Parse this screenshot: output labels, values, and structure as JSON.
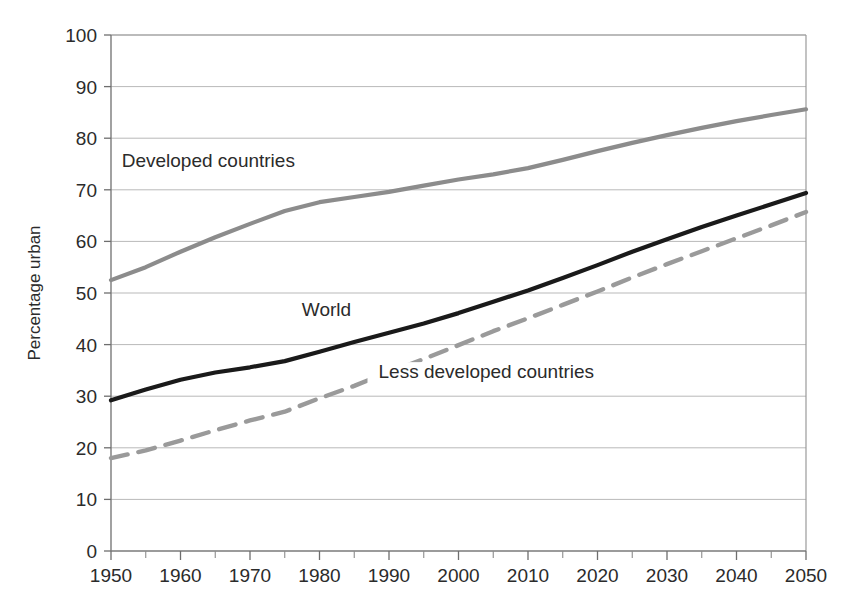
{
  "chart_data": {
    "type": "line",
    "title": "",
    "subtitle": "",
    "xlabel": "",
    "ylabel": "Percentage urban",
    "xlim": [
      1950,
      2050
    ],
    "ylim": [
      0,
      100
    ],
    "grid": "horizontal",
    "legend_position": "inline-annotations",
    "x_tick_labels": [
      "1950",
      "1960",
      "1970",
      "1980",
      "1990",
      "2000",
      "2010",
      "2020",
      "2030",
      "2040",
      "2050"
    ],
    "x_ticks": [
      1950,
      1960,
      1970,
      1980,
      1990,
      2000,
      2010,
      2020,
      2030,
      2040,
      2050
    ],
    "x_minor_ticks": [
      1955,
      1965,
      1975,
      1985,
      1995,
      2005,
      2015,
      2025,
      2035,
      2045
    ],
    "y_tick_labels": [
      "0",
      "10",
      "20",
      "30",
      "40",
      "50",
      "60",
      "70",
      "80",
      "90",
      "100"
    ],
    "y_ticks": [
      0,
      10,
      20,
      30,
      40,
      50,
      60,
      70,
      80,
      90,
      100
    ],
    "x": [
      1950,
      1955,
      1960,
      1965,
      1970,
      1975,
      1980,
      1985,
      1990,
      1995,
      2000,
      2005,
      2010,
      2015,
      2020,
      2025,
      2030,
      2035,
      2040,
      2045,
      2050
    ],
    "series": [
      {
        "name": "Developed countries",
        "color": "#8c8c8c",
        "style": "solid",
        "width": 4.2,
        "label_x": 1964,
        "label_y": 74.5,
        "values": [
          52.5,
          55.0,
          58.0,
          60.8,
          63.4,
          65.9,
          67.6,
          68.6,
          69.6,
          70.8,
          72.0,
          73.0,
          74.2,
          75.8,
          77.5,
          79.1,
          80.6,
          82.0,
          83.3,
          84.5,
          85.6
        ]
      },
      {
        "name": "World",
        "color": "#1a1a1a",
        "style": "solid",
        "width": 4.2,
        "label_x": 1981,
        "label_y": 45.5,
        "values": [
          29.2,
          31.3,
          33.2,
          34.6,
          35.6,
          36.8,
          38.6,
          40.5,
          42.3,
          44.1,
          46.1,
          48.3,
          50.5,
          52.9,
          55.4,
          58.0,
          60.4,
          62.8,
          65.0,
          67.2,
          69.4
        ]
      },
      {
        "name": "Less developed countries",
        "color": "#9a9a9a",
        "style": "dashed",
        "width": 4.4,
        "label_x": 2004,
        "label_y": 33.5,
        "values": [
          18.0,
          19.5,
          21.4,
          23.4,
          25.3,
          27.0,
          29.6,
          32.0,
          34.7,
          37.2,
          39.9,
          42.6,
          45.1,
          47.7,
          50.3,
          53.0,
          55.6,
          58.1,
          60.6,
          63.1,
          65.7
        ]
      }
    ]
  }
}
